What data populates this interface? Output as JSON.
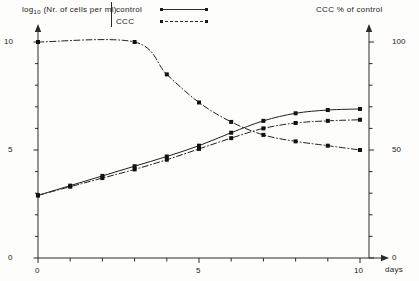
{
  "axes": {
    "y_left": {
      "label_prefix": "log",
      "label_sub": "10",
      "label_rest": " (Nr. of cells per ml)",
      "label_full": "log10 (Nr. of cells per ml)",
      "min": 0,
      "max": 10.5,
      "ticks_major": [
        0,
        5,
        10
      ],
      "tick_labels": [
        "0",
        "5",
        "10"
      ],
      "minor_step": 1
    },
    "y_right": {
      "label": "CCC  % of control",
      "min": 0,
      "max": 110,
      "ticks_major": [
        0,
        50,
        100
      ],
      "tick_labels": [
        "0",
        "50",
        "100"
      ],
      "minor_step": 10
    },
    "x": {
      "label": "days",
      "min": 0,
      "max": 10,
      "ticks_major": [
        0,
        5,
        10
      ],
      "tick_labels": [
        "0",
        "5",
        "10"
      ],
      "minor_step": 1
    }
  },
  "legend": {
    "items": [
      {
        "label": "control",
        "style": "solid"
      },
      {
        "label": "CCC",
        "style": "dash-dot"
      }
    ]
  },
  "colors": {
    "line": "#1f1f1f",
    "marker": "#111111",
    "axis": "#2a2a2a",
    "background": "#fdfdfb"
  },
  "chart_data": {
    "type": "line",
    "title": "",
    "subtitle": "",
    "xlabel": "days",
    "ylabel": "log10 (Nr. of cells per ml)",
    "ylabel_right": "CCC  % of control",
    "xlim": [
      0,
      10
    ],
    "ylim": [
      0,
      10.5
    ],
    "ylim_right": [
      0,
      110
    ],
    "grid": false,
    "legend_position": "top-center",
    "annotations": [],
    "series": [
      {
        "name": "control",
        "axis": "left",
        "style": "solid",
        "marker": "square",
        "x": [
          0,
          1,
          2,
          3,
          4,
          5,
          6,
          7,
          8,
          9,
          10
        ],
        "values": [
          2.9,
          3.35,
          3.8,
          4.25,
          4.7,
          5.2,
          5.8,
          6.35,
          6.7,
          6.85,
          6.9
        ]
      },
      {
        "name": "CCC",
        "axis": "left",
        "style": "dash-dot",
        "marker": "square",
        "x": [
          0,
          1,
          2,
          3,
          4,
          5,
          6,
          7,
          8,
          9,
          10
        ],
        "values": [
          2.9,
          3.3,
          3.7,
          4.1,
          4.55,
          5.05,
          5.55,
          6.0,
          6.25,
          6.35,
          6.4
        ]
      },
      {
        "name": "CCC % of control",
        "axis": "right",
        "style": "dash-dot",
        "marker": "square",
        "x": [
          0,
          3,
          4,
          5,
          6,
          7,
          8,
          9,
          10
        ],
        "values": [
          100,
          100,
          85,
          72,
          63,
          57,
          54,
          52,
          50
        ]
      }
    ]
  }
}
